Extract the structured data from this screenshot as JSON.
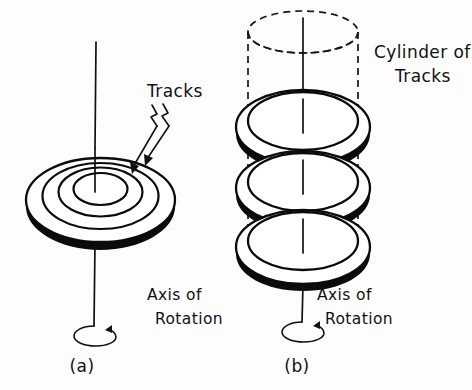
{
  "figure": {
    "background_color": "#fdfdfd",
    "ink_color": "#0b0b0b",
    "style": "hand-drawn line art"
  },
  "panel_a": {
    "caption": "(a)",
    "tracks_label": "Tracks",
    "axis_label_line1": "Axis of",
    "axis_label_line2": "Rotation",
    "platter_count": 1,
    "track_ring_count": 3,
    "rotation_arrow": "curl-arrow"
  },
  "panel_b": {
    "caption": "(b)",
    "cylinder_label_line1": "Cylinder of",
    "cylinder_label_line2": "Tracks",
    "axis_label_line1": "Axis of",
    "axis_label_line2": "Rotation",
    "platter_count": 3,
    "cylinder_outline": "dashed",
    "rotation_arrow": "curl-arrow"
  }
}
